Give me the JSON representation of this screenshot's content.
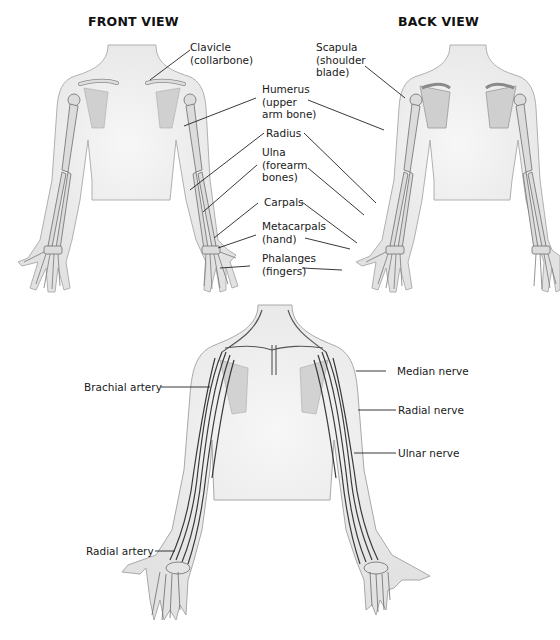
{
  "titles": {
    "front_view": "FRONT VIEW",
    "back_view": "BACK VIEW"
  },
  "bone_labels": {
    "clavicle": [
      "Clavicle",
      "(collarbone)"
    ],
    "scapula": [
      "Scapula",
      "(shoulder",
      "blade)"
    ],
    "humerus": [
      "Humerus",
      "(upper",
      "arm bone)"
    ],
    "radius": [
      "Radius"
    ],
    "ulna": [
      "Ulna",
      "(forearm",
      "bones)"
    ],
    "carpals": [
      "Carpals"
    ],
    "metacarpals": [
      "Metacarpals",
      "(hand)"
    ],
    "phalanges": [
      "Phalanges",
      "(fingers)"
    ]
  },
  "vessel_nerve_labels": {
    "brachial_artery": "Brachial artery",
    "radial_artery": "Radial artery",
    "median_nerve": "Median nerve",
    "radial_nerve": "Radial nerve",
    "ulnar_nerve": "Ulnar nerve"
  },
  "colors": {
    "skin_fill": "#e9e9e9",
    "skin_outline": "#9a9a9a",
    "bone_fill": "#d6d6d6",
    "bone_outline": "#7a7a7a",
    "vessel": "#3a3a3a",
    "leader": "#222222"
  }
}
